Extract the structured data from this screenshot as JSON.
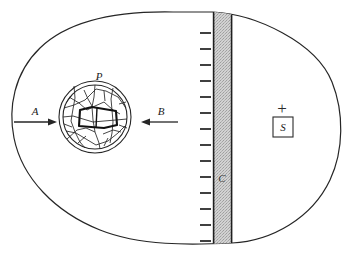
{
  "figure": {
    "background_color": "#ffffff",
    "width": 347,
    "height": 259,
    "line_color": "#262626",
    "band_fill_color": "#cfcfcf",
    "band_edge_color": "#1f1f1f"
  },
  "labels": {
    "arrow_left": "A",
    "arrow_right": "B",
    "circle": "P",
    "band": "C",
    "box": "S",
    "plus": "+"
  },
  "elements": {
    "outer_blob_name": "outer-boundary-blob",
    "circle_name": "fractured-circle-P",
    "band_name": "hatched-vertical-band-C",
    "arrow_a_direction": "right",
    "arrow_b_direction": "left",
    "tick_count": 14,
    "tick_side": "left-of-band"
  },
  "geometry": {
    "band_x_start": 213,
    "band_x_end": 232,
    "band_y_top": 12,
    "band_y_bottom": 243,
    "tick_x_start": 200,
    "tick_x_end": 211,
    "circle_center_x": 95,
    "circle_center_y": 117,
    "circle_outer_r": 36,
    "circle_inner_r": 32,
    "arrow_a_y": 122,
    "arrow_b_y": 122,
    "plus_x": 282,
    "plus_y": 108,
    "box_x": 273,
    "box_y": 117,
    "box_w": 20,
    "box_h": 20
  }
}
